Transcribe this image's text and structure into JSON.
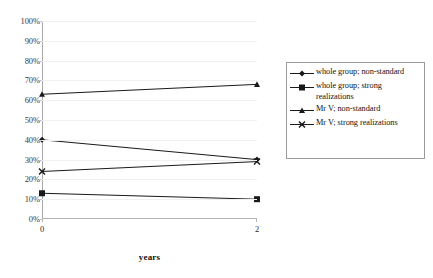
{
  "chart_data": {
    "type": "line",
    "title": "",
    "xlabel": "years",
    "ylabel": "",
    "x": [
      0,
      2
    ],
    "xticklabels": [
      "0",
      "2"
    ],
    "xlim": [
      0,
      2
    ],
    "ylim": [
      0,
      100
    ],
    "yticklabels": [
      "0%",
      "10%",
      "20%",
      "30%",
      "40%",
      "50%",
      "60%",
      "70%",
      "80%",
      "90%",
      "100%"
    ],
    "yticks": [
      0,
      10,
      20,
      30,
      40,
      50,
      60,
      70,
      80,
      90,
      100
    ],
    "grid": true,
    "legend_position": "right",
    "series": [
      {
        "name": "whole group; non-standard",
        "marker": "diamond",
        "color": "#1a1a1a",
        "values": [
          40,
          30
        ]
      },
      {
        "name": "whole group; strong realizations",
        "marker": "square",
        "color": "#1a1a1a",
        "values": [
          13,
          10
        ]
      },
      {
        "name": "Mr V; non-standard",
        "marker": "triangle",
        "color": "#1a1a1a",
        "values": [
          63,
          68
        ]
      },
      {
        "name": "Mr V; strong realizations",
        "marker": "x",
        "color": "#1a1a1a",
        "values": [
          24,
          29
        ]
      }
    ]
  },
  "legend": {
    "entries": [
      {
        "label": "whole group; non-standard",
        "marker": "diamond-marker-icon"
      },
      {
        "label": "whole group; strong realizations",
        "marker": "square-marker-icon"
      },
      {
        "label": "Mr V; non-standard",
        "marker": "triangle-marker-icon"
      },
      {
        "label": "Mr V; strong realizations",
        "marker": "x-marker-icon"
      }
    ]
  },
  "axes": {
    "x_title": "years",
    "x_tick_labels": [
      "0",
      "2"
    ],
    "y_tick_labels": [
      "100%",
      "90%",
      "80%",
      "70%",
      "60%",
      "50%",
      "40%",
      "30%",
      "20%",
      "10%",
      "0%"
    ]
  }
}
